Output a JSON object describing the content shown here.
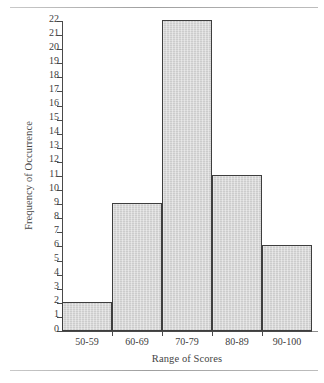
{
  "chart_data": {
    "type": "bar",
    "title": "",
    "subtitle": "",
    "xlabel": "Range of Scores",
    "ylabel": "Frequency of Occurrence",
    "categories": [
      "50-59",
      "60-69",
      "70-79",
      "80-89",
      "90-100"
    ],
    "values": [
      2,
      9,
      22,
      11,
      6
    ],
    "ylim": [
      0,
      22
    ],
    "ytick_step": 1,
    "yticks": [
      0,
      1,
      2,
      3,
      4,
      5,
      6,
      7,
      8,
      9,
      10,
      11,
      12,
      13,
      14,
      15,
      16,
      17,
      18,
      19,
      20,
      21,
      22
    ],
    "ytick_labels": [
      "0",
      "1",
      "2",
      "3",
      "4",
      "5",
      "6",
      "7",
      "8",
      "9",
      "10",
      "11",
      "12",
      "13",
      "14",
      "15",
      "16",
      "17",
      "18",
      "19",
      "20",
      "21",
      "22"
    ],
    "grid": false,
    "legend": false,
    "legend_position": "none",
    "bar_gap": 0,
    "colors": {
      "bar_fill": "#d3d3d3",
      "bar_border": "#3e3e3e",
      "axis": "#4a4a4a",
      "text": "#3c3c3c",
      "background": "#ffffff",
      "page_rule": "#a8a8a8"
    },
    "annotations": []
  }
}
